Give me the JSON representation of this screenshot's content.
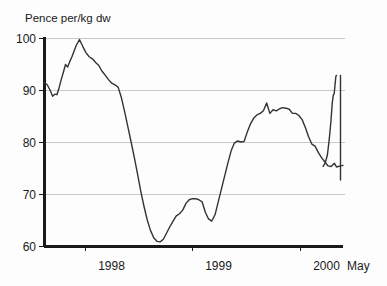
{
  "chart_data": {
    "type": "line",
    "title": "",
    "subtitle": "",
    "ylabel": "Pence per/kg dw",
    "xlabel": "",
    "ylim": [
      60,
      100
    ],
    "y_ticks": [
      60,
      70,
      80,
      90,
      100
    ],
    "y_tick_labels": [
      "60",
      "70",
      "80",
      "90",
      "100"
    ],
    "x_ticks": [
      1998.0,
      1999.0,
      2000.0
    ],
    "x_tick_labels": [
      "1998",
      "1999",
      "2000"
    ],
    "x_axis_end_label": "May",
    "xlim": [
      1997.62,
      2000.4
    ],
    "grid": "horizontal",
    "legend": "none",
    "series": [
      {
        "name": "Price",
        "color": "#333333",
        "x": [
          1997.62,
          1997.65,
          1997.68,
          1997.7,
          1997.72,
          1997.74,
          1997.76,
          1997.78,
          1997.8,
          1997.82,
          1997.84,
          1997.86,
          1997.88,
          1997.9,
          1997.92,
          1997.95,
          1997.98,
          1998.01,
          1998.04,
          1998.07,
          1998.1,
          1998.13,
          1998.16,
          1998.19,
          1998.22,
          1998.25,
          1998.28,
          1998.31,
          1998.34,
          1998.37,
          1998.4,
          1998.43,
          1998.46,
          1998.49,
          1998.52,
          1998.55,
          1998.58,
          1998.61,
          1998.64,
          1998.67,
          1998.7,
          1998.73,
          1998.76,
          1998.79,
          1998.82,
          1998.85,
          1998.88,
          1998.91,
          1998.94,
          1998.97,
          1999.0,
          1999.03,
          1999.06,
          1999.09,
          1999.12,
          1999.15,
          1999.18,
          1999.21,
          1999.24,
          1999.27,
          1999.3,
          1999.33,
          1999.36,
          1999.39,
          1999.42,
          1999.45,
          1999.48,
          1999.51,
          1999.54,
          1999.57,
          1999.6,
          1999.63,
          1999.66,
          1999.69,
          1999.72,
          1999.75,
          1999.78,
          1999.81,
          1999.84,
          1999.87,
          1999.9,
          1999.93,
          1999.96,
          1999.99,
          2000.02,
          2000.05,
          2000.08,
          2000.11,
          2000.14,
          2000.17,
          2000.2,
          2000.23,
          2000.26,
          2000.29,
          2000.32,
          2000.34,
          2000.36
        ],
        "y": [
          91.5,
          91.0,
          89.8,
          88.8,
          89.2,
          89.1,
          90.4,
          92.0,
          93.4,
          94.9,
          94.4,
          95.5,
          96.4,
          97.5,
          98.6,
          99.7,
          98.4,
          97.2,
          96.4,
          96.0,
          95.3,
          94.7,
          93.6,
          92.8,
          92.0,
          91.3,
          91.0,
          90.5,
          88.5,
          85.8,
          82.9,
          80.0,
          77.0,
          73.8,
          70.5,
          67.6,
          65.0,
          63.0,
          61.6,
          60.9,
          60.8,
          61.3,
          62.5,
          63.7,
          64.8,
          65.8,
          66.2,
          66.9,
          68.2,
          68.9,
          69.1,
          69.1,
          68.9,
          68.5,
          66.5,
          65.2,
          64.8,
          66.0,
          68.5,
          71.0,
          73.5,
          76.0,
          78.3,
          79.8,
          80.2,
          80.0,
          80.1,
          81.9,
          83.5,
          84.6,
          85.2,
          85.5,
          86.0,
          87.5,
          85.5,
          86.2,
          86.0,
          86.4,
          86.6,
          86.5,
          86.3,
          85.5,
          85.5,
          85.1,
          84.3,
          82.8,
          81.0,
          79.6,
          79.2,
          78.0,
          77.0,
          76.2,
          75.4,
          75.3,
          75.9,
          75.2,
          75.3
        ]
      },
      {
        "name": "Price-continued",
        "color": "#333333",
        "x": [
          2000.36,
          2000.38,
          2000.4
        ],
        "y": [
          75.3,
          75.4,
          75.5
        ]
      }
    ],
    "annotations": []
  },
  "colors": {
    "line": "#333333",
    "grid": "#c9c9c9",
    "axis": "#1a1a1a",
    "background": "#fdfdfd"
  }
}
